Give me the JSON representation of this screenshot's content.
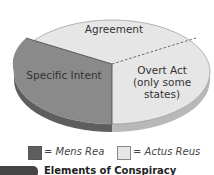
{
  "diagram": {
    "type": "pie",
    "slices": [
      {
        "label": "Agreement",
        "category": "Actus Reus"
      },
      {
        "label": "Specific Intent",
        "category": "Mens Rea"
      },
      {
        "label_lines": [
          "Overt Act",
          "(only some",
          "states)"
        ],
        "category": "Actus Reus",
        "note": "dashed boundary"
      }
    ]
  },
  "legend": {
    "mens_rea": "= Mens Rea",
    "actus_reus": "= Actus Reus"
  },
  "caption": {
    "text": "Elements of Conspiracy"
  },
  "colors": {
    "mens_rea": "#8a8a8a",
    "actus_reus": "#e6e6e6",
    "mens_rea_side": "#5e5e5e",
    "actus_reus_side": "#b8b8b8"
  }
}
